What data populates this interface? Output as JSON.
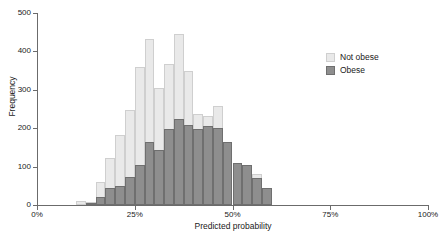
{
  "chart_data": {
    "type": "bar",
    "subtype": "overlapping-histogram",
    "title": "",
    "xlabel": "Predicted probability",
    "ylabel": "Frequency",
    "xlim": [
      0,
      100
    ],
    "ylim": [
      0,
      500
    ],
    "grid": false,
    "bin_width": 2.5,
    "x_tick_labels": [
      "0%",
      "25%",
      "50%",
      "75%",
      "100%"
    ],
    "x_tick_values": [
      0,
      25,
      50,
      75,
      100
    ],
    "y_tick_labels": [
      "0",
      "100",
      "200",
      "300",
      "400",
      "500"
    ],
    "y_tick_values": [
      0,
      100,
      200,
      300,
      400,
      500
    ],
    "legend_position": "top-right",
    "bin_starts": [
      10,
      12.5,
      15,
      17.5,
      20,
      22.5,
      25,
      27.5,
      30,
      32.5,
      35,
      37.5,
      40,
      42.5,
      45,
      47.5,
      50,
      52.5,
      55,
      57.5
    ],
    "series": [
      {
        "name": "Not obese",
        "color": "#e9e9e9",
        "edge_color": "#cfcfcf",
        "values": [
          10,
          7,
          60,
          123,
          182,
          248,
          360,
          432,
          305,
          367,
          445,
          348,
          236,
          231,
          259,
          165,
          110,
          105,
          82,
          45
        ]
      },
      {
        "name": "Obese",
        "color": "#8e8e8e",
        "edge_color": "#6f6f6f",
        "values": [
          0,
          5,
          20,
          45,
          50,
          72,
          105,
          165,
          142,
          198,
          223,
          209,
          199,
          207,
          201,
          165,
          110,
          105,
          70,
          45
        ]
      }
    ]
  },
  "legend": {
    "items": [
      {
        "label": "Not obese",
        "swatch_class": "not-obese"
      },
      {
        "label": "Obese",
        "swatch_class": "obese"
      }
    ]
  }
}
